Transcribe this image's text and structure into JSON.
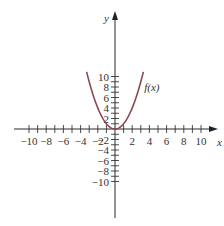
{
  "chart_data": {
    "type": "line",
    "title": "",
    "xlabel": "x",
    "ylabel": "y",
    "xlim": [
      -10,
      10
    ],
    "ylim": [
      -10,
      10
    ],
    "grid": false,
    "x_ticks": [
      -10,
      -8,
      -6,
      -4,
      -2,
      2,
      4,
      6,
      8,
      10
    ],
    "x_tick_labels": [
      "−10",
      "−8",
      "−6",
      "−4",
      "−2",
      "2",
      "4",
      "6",
      "8",
      "10"
    ],
    "y_ticks": [
      -10,
      -8,
      -6,
      -4,
      -2,
      2,
      4,
      6,
      8,
      10
    ],
    "y_tick_labels": [
      "−10",
      "−8",
      "−6",
      "−4",
      "−2",
      "2",
      "4",
      "6",
      "8",
      "10"
    ],
    "minor_tick_step": 1,
    "series": [
      {
        "name": "f(x)",
        "formula": "x^2",
        "x": [
          -3.3,
          -3,
          -2.5,
          -2,
          -1.5,
          -1,
          -0.5,
          0,
          0.5,
          1,
          1.5,
          2,
          2.5,
          3,
          3.3
        ],
        "y": [
          10.89,
          9,
          6.25,
          4,
          2.25,
          1,
          0.25,
          0,
          0.25,
          1,
          2.25,
          4,
          6.25,
          9,
          10.89
        ],
        "color": "#8a4a4f"
      }
    ],
    "annotations": [
      {
        "text": "f(x)",
        "x": 3.4,
        "y": 8
      }
    ]
  }
}
